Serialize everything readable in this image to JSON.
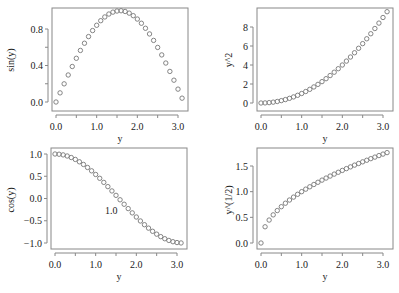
{
  "chart_data": [
    {
      "type": "scatter",
      "title": "",
      "xlabel": "y",
      "ylabel": "sin(y)",
      "x_ticks": [
        "0.0",
        "1.0",
        "2.0",
        "3.0"
      ],
      "y_ticks": [
        "0.0",
        "0.4",
        "0.8"
      ],
      "xlim": [
        0,
        3.1
      ],
      "ylim": [
        0,
        1
      ],
      "x": [
        0,
        0.1,
        0.2,
        0.3,
        0.4,
        0.5,
        0.6,
        0.7,
        0.8,
        0.9,
        1.0,
        1.1,
        1.2,
        1.3,
        1.4,
        1.5,
        1.6,
        1.7,
        1.8,
        1.9,
        2.0,
        2.1,
        2.2,
        2.3,
        2.4,
        2.5,
        2.6,
        2.7,
        2.8,
        2.9,
        3.0,
        3.1
      ],
      "values": [
        0,
        0.1,
        0.199,
        0.296,
        0.389,
        0.479,
        0.565,
        0.644,
        0.717,
        0.783,
        0.841,
        0.891,
        0.932,
        0.964,
        0.985,
        0.997,
        1.0,
        0.992,
        0.974,
        0.946,
        0.909,
        0.863,
        0.808,
        0.746,
        0.675,
        0.598,
        0.516,
        0.427,
        0.335,
        0.239,
        0.141,
        0.042
      ]
    },
    {
      "type": "scatter",
      "title": "",
      "xlabel": "y",
      "ylabel": "y^2",
      "x_ticks": [
        "0.0",
        "1.0",
        "2.0",
        "3.0"
      ],
      "y_ticks": [
        "0",
        "2",
        "4",
        "6",
        "8"
      ],
      "xlim": [
        0,
        3.1
      ],
      "ylim": [
        0,
        9.61
      ],
      "x": [
        0,
        0.1,
        0.2,
        0.3,
        0.4,
        0.5,
        0.6,
        0.7,
        0.8,
        0.9,
        1.0,
        1.1,
        1.2,
        1.3,
        1.4,
        1.5,
        1.6,
        1.7,
        1.8,
        1.9,
        2.0,
        2.1,
        2.2,
        2.3,
        2.4,
        2.5,
        2.6,
        2.7,
        2.8,
        2.9,
        3.0,
        3.1
      ],
      "values": [
        0,
        0.01,
        0.04,
        0.09,
        0.16,
        0.25,
        0.36,
        0.49,
        0.64,
        0.81,
        1.0,
        1.21,
        1.44,
        1.69,
        1.96,
        2.25,
        2.56,
        2.89,
        3.24,
        3.61,
        4.0,
        4.41,
        4.84,
        5.29,
        5.76,
        6.25,
        6.76,
        7.29,
        7.84,
        8.41,
        9.0,
        9.61
      ]
    },
    {
      "type": "scatter",
      "title": "",
      "xlabel": "y",
      "ylabel": "cos(y)",
      "x_ticks": [
        "0.0",
        "1.0",
        "2.0",
        "3.0"
      ],
      "y_ticks": [
        "-1.0",
        "-0.5",
        "0.0",
        "0.5",
        "1.0"
      ],
      "xlim": [
        0,
        3.1
      ],
      "ylim": [
        -1,
        1
      ],
      "annotation": "1.0",
      "x": [
        0,
        0.1,
        0.2,
        0.3,
        0.4,
        0.5,
        0.6,
        0.7,
        0.8,
        0.9,
        1.0,
        1.1,
        1.2,
        1.3,
        1.4,
        1.5,
        1.6,
        1.7,
        1.8,
        1.9,
        2.0,
        2.1,
        2.2,
        2.3,
        2.4,
        2.5,
        2.6,
        2.7,
        2.8,
        2.9,
        3.0,
        3.1
      ],
      "values": [
        1.0,
        0.995,
        0.98,
        0.955,
        0.921,
        0.878,
        0.825,
        0.765,
        0.697,
        0.622,
        0.54,
        0.454,
        0.362,
        0.267,
        0.17,
        0.071,
        -0.029,
        -0.129,
        -0.227,
        -0.323,
        -0.416,
        -0.505,
        -0.589,
        -0.666,
        -0.737,
        -0.801,
        -0.857,
        -0.904,
        -0.942,
        -0.971,
        -0.99,
        -0.999
      ]
    },
    {
      "type": "scatter",
      "title": "",
      "xlabel": "y",
      "ylabel": "y^(1/2)",
      "x_ticks": [
        "0.0",
        "1.0",
        "2.0",
        "3.0"
      ],
      "y_ticks": [
        "0.0",
        "0.5",
        "1.0",
        "1.5"
      ],
      "xlim": [
        0,
        3.1
      ],
      "ylim": [
        0,
        1.76
      ],
      "x": [
        0,
        0.1,
        0.2,
        0.3,
        0.4,
        0.5,
        0.6,
        0.7,
        0.8,
        0.9,
        1.0,
        1.1,
        1.2,
        1.3,
        1.4,
        1.5,
        1.6,
        1.7,
        1.8,
        1.9,
        2.0,
        2.1,
        2.2,
        2.3,
        2.4,
        2.5,
        2.6,
        2.7,
        2.8,
        2.9,
        3.0,
        3.1
      ],
      "values": [
        0,
        0.316,
        0.447,
        0.548,
        0.632,
        0.707,
        0.775,
        0.837,
        0.894,
        0.949,
        1.0,
        1.049,
        1.095,
        1.14,
        1.183,
        1.225,
        1.265,
        1.304,
        1.342,
        1.378,
        1.414,
        1.449,
        1.483,
        1.517,
        1.549,
        1.581,
        1.612,
        1.643,
        1.673,
        1.703,
        1.732,
        1.761
      ]
    }
  ],
  "panels": [
    {
      "ylabel": "sin(y)",
      "xlabel": "y"
    },
    {
      "ylabel": "y^2",
      "xlabel": "y"
    },
    {
      "ylabel": "cos(y)",
      "xlabel": "y",
      "annotation": "1.0"
    },
    {
      "ylabel": "y^(1/2)",
      "xlabel": "y"
    }
  ],
  "colors": {
    "axis": "#888888",
    "marker": "#777777",
    "text": "#222222"
  }
}
